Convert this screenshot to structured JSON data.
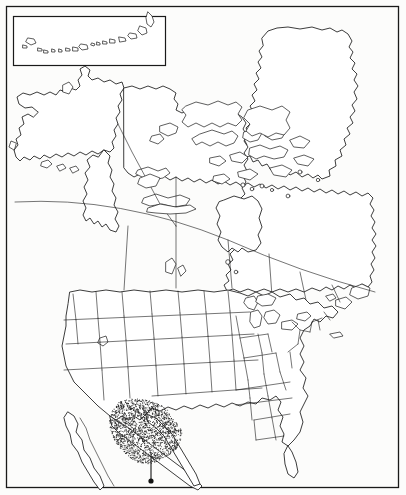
{
  "figure": {
    "kind": "reference-outline-map",
    "background_color": "#fcfcfb",
    "line_color": "#1a1a1a",
    "frame": {
      "x": 6,
      "y": 6,
      "width": 393,
      "height": 482
    }
  },
  "inset": {
    "name": "aleutian-islands-inset",
    "label": "",
    "box": {
      "x": 13,
      "y": 16,
      "width": 153,
      "height": 50
    }
  },
  "regions": [
    {
      "id": "alaska",
      "label": "Alaska"
    },
    {
      "id": "canada",
      "label": "Canada"
    },
    {
      "id": "greenland",
      "label": "Greenland"
    },
    {
      "id": "united-states",
      "label": "United States"
    },
    {
      "id": "mexico",
      "label": "Mexico"
    },
    {
      "id": "baja-california",
      "label": "Baja California"
    },
    {
      "id": "hudson-bay",
      "label": "Hudson Bay"
    },
    {
      "id": "great-lakes",
      "label": "Great Lakes"
    },
    {
      "id": "newfoundland",
      "label": "Newfoundland"
    }
  ],
  "shaded_area": {
    "name": "stippled-range-area",
    "label": "",
    "style": "stipple",
    "dot_color": "#2b2b2b",
    "dot_count": 1650,
    "approx_extent": "US Southwest into northern Mexico",
    "bbox": {
      "x": 108,
      "y": 400,
      "width": 80,
      "height": 68
    }
  },
  "leader": {
    "name": "leader-pointer",
    "x": 151,
    "y_top": 452,
    "y_bottom": 480
  },
  "colors": {
    "ink": "#1a1a1a",
    "paper": "#fcfcfb",
    "stipple": "#2b2b2b"
  }
}
